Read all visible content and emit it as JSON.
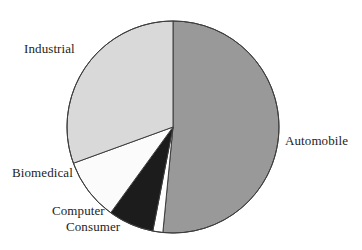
{
  "chart_data": {
    "type": "pie",
    "title": "",
    "subtitle": "",
    "xlabel": "",
    "ylabel": "",
    "grid": false,
    "legend_position": "none",
    "label_style": "outside-callout",
    "start_angle_deg": 0,
    "direction": "clockwise",
    "categories": [
      "Automobile",
      "Consumer",
      "Computer",
      "Biomedical",
      "Industrial"
    ],
    "values": [
      51.5,
      1.5,
      7.0,
      9.5,
      30.5
    ],
    "slices": [
      {
        "label": "Automobile",
        "value": 51.5,
        "start_angle_deg": 0,
        "end_angle_deg": 185.5,
        "color": "#999999",
        "edge_color": "#3d3d3d"
      },
      {
        "label": "Consumer",
        "value": 1.5,
        "start_angle_deg": 185.5,
        "end_angle_deg": 191.0,
        "color": "#ffffff",
        "edge_color": "#3d3d3d"
      },
      {
        "label": "Computer",
        "value": 7.0,
        "start_angle_deg": 191.0,
        "end_angle_deg": 216.0,
        "color": "#1c1c1c",
        "edge_color": "#3d3d3d"
      },
      {
        "label": "Biomedical",
        "value": 9.5,
        "start_angle_deg": 216.0,
        "end_angle_deg": 250.0,
        "color": "#fbfbfb",
        "edge_color": "#3d3d3d"
      },
      {
        "label": "Industrial",
        "value": 30.5,
        "start_angle_deg": 250.0,
        "end_angle_deg": 360.0,
        "color": "#d9d9d9",
        "edge_color": "#3d3d3d"
      }
    ]
  },
  "labels": {
    "industrial": "Industrial",
    "biomedical": "Biomedical",
    "computer": "Computer",
    "consumer": "Consumer",
    "automobile": "Automobile"
  },
  "colors": {
    "background": "#ffffff",
    "outline": "#3d3d3d",
    "text": "#232323",
    "automobile": "#999999",
    "industrial": "#d9d9d9",
    "biomedical": "#fbfbfb",
    "computer": "#1c1c1c",
    "consumer": "#ffffff"
  },
  "geometry": {
    "center_x": 173,
    "center_y": 127,
    "radius": 106
  }
}
